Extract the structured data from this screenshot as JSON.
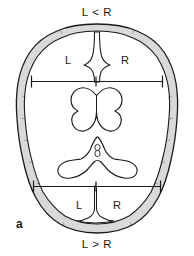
{
  "figure": {
    "panel_label": "a",
    "background_color": "#ffffff",
    "width": 194,
    "height": 256
  },
  "labels": {
    "top_comparison": "L < R",
    "bottom_comparison": "L > R",
    "frontal_left": "L",
    "frontal_right": "R",
    "occipital_left": "L",
    "occipital_right": "R"
  },
  "colors": {
    "outline": "#1a1a1a",
    "skull_fill": "#d9d9d9",
    "brain_fill": "#ffffff",
    "text": "#1a1a1a",
    "measure_line": "#1a1a1a"
  },
  "structures": {
    "skull": "skull-outline",
    "frontal_ventricles": "butterfly-lateral-ventricles",
    "cistern": "quadrigeminal-cistern",
    "cistern_vessels": "paired-oval-vessels",
    "midline_fissure_anterior": "anterior-interhemispheric-fissure",
    "midline_fissure_posterior": "posterior-interhemispheric-fissure"
  },
  "measurements": {
    "anterior_line": "anterior-width-measurement",
    "posterior_line": "posterior-width-measurement",
    "tick_style": "vertical-end-caps-with-center-tick"
  }
}
